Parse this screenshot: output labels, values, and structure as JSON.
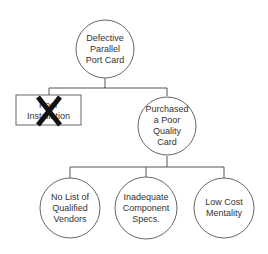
{
  "diagram": {
    "type": "cause-tree",
    "colors": {
      "line": "#555555",
      "text": "#333333",
      "cross": "#111111",
      "background": "#ffffff"
    },
    "root": {
      "label": "Defective Parallel Port Card",
      "lines": [
        "Defective",
        "Parallel",
        "Port Card"
      ],
      "shape": "circle"
    },
    "level2": [
      {
        "label": "Poor Installation",
        "lines": [
          "Poor",
          "Installation"
        ],
        "shape": "rectangle",
        "crossed_out": true
      },
      {
        "label": "Purchased a Poor Quality Card",
        "lines": [
          "Purchased",
          "a Poor",
          "Quality",
          "Card"
        ],
        "shape": "circle"
      }
    ],
    "level3": [
      {
        "label": "No List of Qualified Vendors",
        "lines": [
          "No List of",
          "Qualified",
          "Vendors"
        ],
        "shape": "circle"
      },
      {
        "label": "Inadequate Component Specs.",
        "lines": [
          "Inadequate",
          "Component",
          "Specs."
        ],
        "shape": "circle"
      },
      {
        "label": "Low Cost Mentality",
        "lines": [
          "Low Cost",
          "Mentality"
        ],
        "shape": "circle"
      }
    ]
  }
}
